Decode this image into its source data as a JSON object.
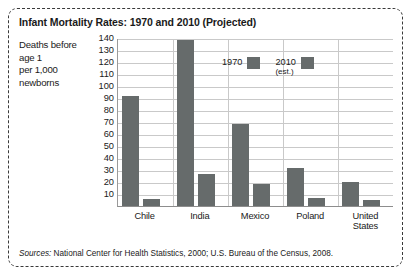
{
  "chart_data": {
    "type": "bar",
    "title": "Infant Mortality Rates: 1970 and 2010 (Projected)",
    "categories": [
      "Chile",
      "India",
      "Mexico",
      "Poland",
      "United States"
    ],
    "series": [
      {
        "name": "1970",
        "values": [
          92,
          138,
          68,
          32,
          20
        ]
      },
      {
        "name": "2010 (est.)",
        "values": [
          6,
          27,
          18,
          7,
          5
        ]
      }
    ],
    "ylabel": "Deaths before age 1 per 1,000 newborns",
    "ylabel_lines": [
      "Deaths before",
      "age 1",
      "per 1,000",
      "newborns"
    ],
    "xlabel": "",
    "ylim": [
      0,
      140
    ],
    "yticks": [
      10,
      20,
      30,
      40,
      50,
      60,
      70,
      80,
      90,
      100,
      110,
      120,
      130,
      140
    ],
    "ytick_labels": [
      "10",
      "20",
      "30",
      "40",
      "50",
      "60",
      "70",
      "80",
      "90",
      "100",
      "110",
      "120",
      "130",
      "140"
    ],
    "grid": true,
    "legend_position": "inside-upper-right",
    "bar_color": "#666b6b",
    "legend": [
      {
        "label": "1970",
        "sublabel": ""
      },
      {
        "label": "2010",
        "sublabel": "(est.)"
      }
    ],
    "category_labels": [
      {
        "line1": "Chile",
        "line2": ""
      },
      {
        "line1": "India",
        "line2": ""
      },
      {
        "line1": "Mexico",
        "line2": ""
      },
      {
        "line1": "Poland",
        "line2": ""
      },
      {
        "line1": "United",
        "line2": "States"
      }
    ]
  },
  "sources": {
    "lead": "Sources:",
    "text": " National Center for Health Statistics, 2000; U.S. Bureau of the Census, 2008."
  }
}
